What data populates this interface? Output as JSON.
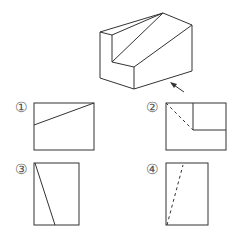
{
  "figure": {
    "stroke_color": "#333333",
    "arrow_label": "viewing direction"
  },
  "options": [
    {
      "label": "①",
      "id": "1"
    },
    {
      "label": "②",
      "id": "2"
    },
    {
      "label": "③",
      "id": "3"
    },
    {
      "label": "④",
      "id": "4"
    }
  ]
}
